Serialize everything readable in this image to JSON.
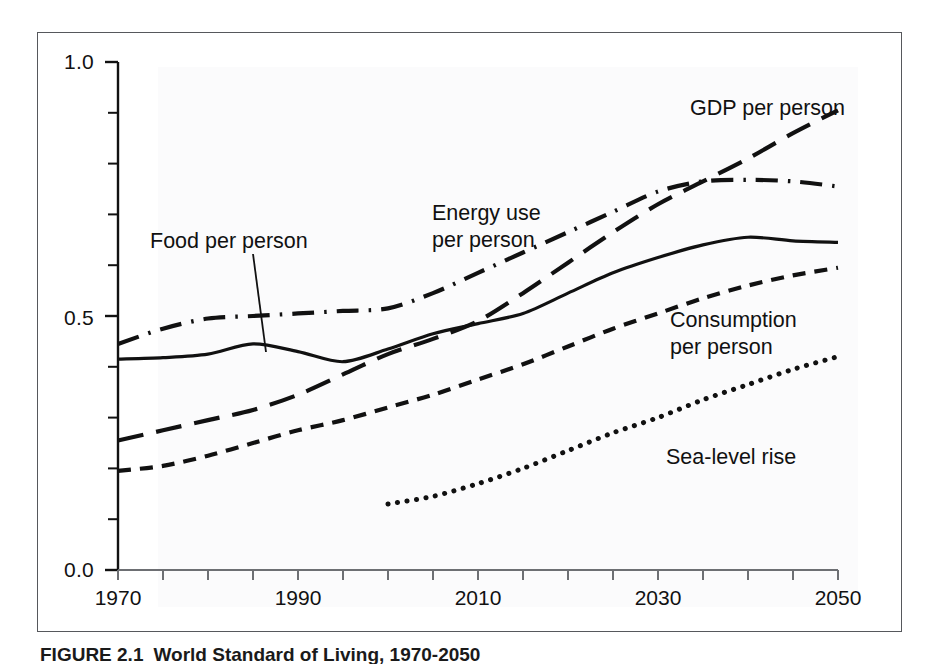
{
  "figure": {
    "caption_number": "FIGURE 2.1",
    "caption_text": "World Standard of Living, 1970-2050"
  },
  "axes": {
    "y_ticks": [
      "0.0",
      "0.5",
      "1.0"
    ],
    "x_ticks": [
      "1970",
      "1990",
      "2010",
      "2030",
      "2050"
    ]
  },
  "labels": {
    "food": "Food per person",
    "energy_line1": "Energy use",
    "energy_line2": "per person",
    "gdp": "GDP per person",
    "consumption_line1": "Consumption",
    "consumption_line2": "per person",
    "sealevel": "Sea-level rise"
  },
  "chart_data": {
    "type": "line",
    "title": "World Standard of Living, 1970-2050",
    "xlabel": "",
    "ylabel": "",
    "xlim": [
      1970,
      2050
    ],
    "ylim": [
      0.0,
      1.0
    ],
    "yticks": [
      0.0,
      0.5,
      1.0
    ],
    "yticks_minor_step": 0.1,
    "xticks": [
      1970,
      1990,
      2010,
      2030,
      2050
    ],
    "xticks_minor_step": 5,
    "grid": false,
    "legend": "inline-annotations",
    "line_color": "#111111",
    "series": [
      {
        "name": "GDP per person",
        "dash": "long-dash",
        "x": [
          1970,
          1975,
          1980,
          1985,
          1990,
          1995,
          2000,
          2005,
          2010,
          2015,
          2020,
          2025,
          2030,
          2035,
          2040,
          2045,
          2050
        ],
        "values": [
          0.255,
          0.275,
          0.295,
          0.315,
          0.345,
          0.385,
          0.425,
          0.455,
          0.49,
          0.545,
          0.605,
          0.665,
          0.72,
          0.765,
          0.81,
          0.86,
          0.905
        ]
      },
      {
        "name": "Energy use per person",
        "dash": "dash-dot",
        "x": [
          1970,
          1975,
          1980,
          1985,
          1990,
          1995,
          2000,
          2005,
          2010,
          2015,
          2020,
          2025,
          2030,
          2035,
          2040,
          2045,
          2050
        ],
        "values": [
          0.445,
          0.475,
          0.495,
          0.5,
          0.505,
          0.51,
          0.515,
          0.545,
          0.585,
          0.625,
          0.665,
          0.705,
          0.745,
          0.765,
          0.768,
          0.765,
          0.755
        ]
      },
      {
        "name": "Food per person",
        "dash": "solid",
        "x": [
          1970,
          1975,
          1980,
          1985,
          1990,
          1995,
          2000,
          2005,
          2010,
          2015,
          2020,
          2025,
          2030,
          2035,
          2040,
          2045,
          2050
        ],
        "values": [
          0.415,
          0.418,
          0.425,
          0.445,
          0.43,
          0.41,
          0.435,
          0.465,
          0.485,
          0.505,
          0.545,
          0.585,
          0.615,
          0.64,
          0.655,
          0.648,
          0.645
        ]
      },
      {
        "name": "Consumption per person",
        "dash": "short-dash",
        "x": [
          1970,
          1975,
          1980,
          1985,
          1990,
          1995,
          2000,
          2005,
          2010,
          2015,
          2020,
          2025,
          2030,
          2035,
          2040,
          2045,
          2050
        ],
        "values": [
          0.195,
          0.205,
          0.225,
          0.25,
          0.275,
          0.295,
          0.32,
          0.345,
          0.375,
          0.405,
          0.44,
          0.475,
          0.505,
          0.535,
          0.56,
          0.58,
          0.595
        ]
      },
      {
        "name": "Sea-level rise",
        "dash": "dotted",
        "x": [
          2000,
          2005,
          2010,
          2015,
          2020,
          2025,
          2030,
          2035,
          2040,
          2045,
          2050
        ],
        "values": [
          0.13,
          0.145,
          0.17,
          0.2,
          0.235,
          0.27,
          0.3,
          0.335,
          0.365,
          0.395,
          0.42
        ]
      }
    ]
  }
}
